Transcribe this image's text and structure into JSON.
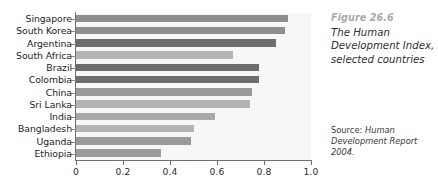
{
  "caption": {
    "figure_number": "Figure 26.6",
    "title": "The Human Development Index, selected countries",
    "source_prefix": "Source: ",
    "source_body": "Human Development Report 2004."
  },
  "chart_data": {
    "type": "bar",
    "orientation": "horizontal",
    "title": "The Human Development Index, selected countries",
    "xlabel": "",
    "ylabel": "",
    "xlim": [
      0,
      1.0
    ],
    "xticks": [
      "0",
      "0.2",
      "0.4",
      "0.6",
      "0.8",
      "1.0"
    ],
    "xtick_values": [
      0,
      0.2,
      0.4,
      0.6,
      0.8,
      1.0
    ],
    "grid": false,
    "legend": "none",
    "categories": [
      "Singapore",
      "South Korea",
      "Argentina",
      "South Africa",
      "Brazil",
      "Colombia",
      "China",
      "Sri Lanka",
      "India",
      "Bangladesh",
      "Uganda",
      "Ethiopia"
    ],
    "values": [
      0.9,
      0.89,
      0.85,
      0.67,
      0.78,
      0.78,
      0.75,
      0.74,
      0.59,
      0.5,
      0.49,
      0.36
    ],
    "bar_colors": [
      "#8f8f8f",
      "#8f8f8f",
      "#6d6d6d",
      "#b4b4b4",
      "#6d6d6d",
      "#6d6d6d",
      "#9a9a9a",
      "#b4b4b4",
      "#a8a8a8",
      "#b4b4b4",
      "#9a9a9a",
      "#9a9a9a"
    ],
    "plot_background": "#f7f7f7",
    "axis_color": "#6f6f6f"
  }
}
